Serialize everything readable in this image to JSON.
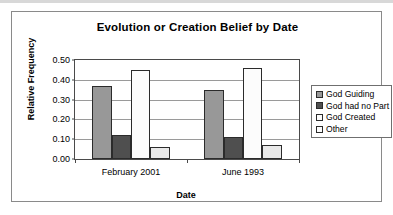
{
  "chart_data": {
    "type": "bar",
    "title": "Evolution or Creation Belief by Date",
    "xlabel": "Date",
    "ylabel": "Relative Frequency",
    "categories": [
      "February 2001",
      "June 1993"
    ],
    "series": [
      {
        "name": "God Guiding",
        "values": [
          0.37,
          0.35
        ],
        "color": "#989898"
      },
      {
        "name": "God had no Part",
        "values": [
          0.12,
          0.11
        ],
        "color": "#4f4f4f"
      },
      {
        "name": "God Created",
        "values": [
          0.45,
          0.46
        ],
        "color": "#fcfcfc"
      },
      {
        "name": "Other",
        "values": [
          0.06,
          0.07
        ],
        "color": "#e9e9e9"
      }
    ],
    "ylim": [
      0.0,
      0.5
    ],
    "ytick_labels": [
      "0.00",
      "0.10",
      "0.20",
      "0.30",
      "0.40",
      "0.50"
    ],
    "ytick_values": [
      0.0,
      0.1,
      0.2,
      0.3,
      0.4,
      0.5
    ],
    "grid": true,
    "legend_position": "right"
  }
}
